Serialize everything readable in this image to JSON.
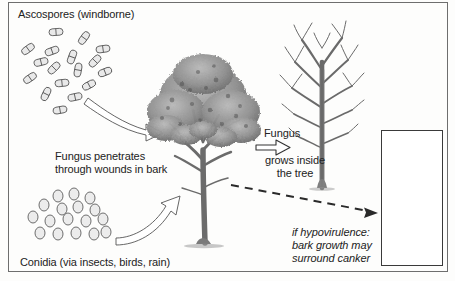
{
  "figure": {
    "border_color": "#6e6e6e",
    "background": "#fdfdfc",
    "ink_color": "#222222"
  },
  "labels": {
    "ascospores": "Ascospores (windborne)",
    "penetrates": "Fungus penetrates\nthrough wounds in bark",
    "conidia": "Conidia (via insects, birds, rain)",
    "fungus_top": "Fungus",
    "fungus_bottom": "grows inside\nthe tree",
    "hypovirulence": "if hypovirulence:\nbark growth may\nsurround canker"
  },
  "spores": {
    "ascospore_label": "ascospore",
    "ascospore_shape": "two-celled capsule",
    "ascospore_count": 17,
    "conidium_label": "conidium",
    "conidium_shape": "oval",
    "conidium_count": 17
  },
  "arrows": {
    "ascospore_arrow": "curved-outline-arrow-down-right",
    "conidia_arrow": "curved-outline-arrow-up-right",
    "infection_arrow": "straight-open-arrow-right",
    "hypovirulence_arrow": "dashed-arrow-down-right"
  },
  "trees": {
    "healthy_label": "healthy leafy chestnut tree",
    "dead_label": "bare dead chestnut tree"
  },
  "inset": {
    "caption": "canker on trunk",
    "border_color": "#3a3a3a"
  }
}
